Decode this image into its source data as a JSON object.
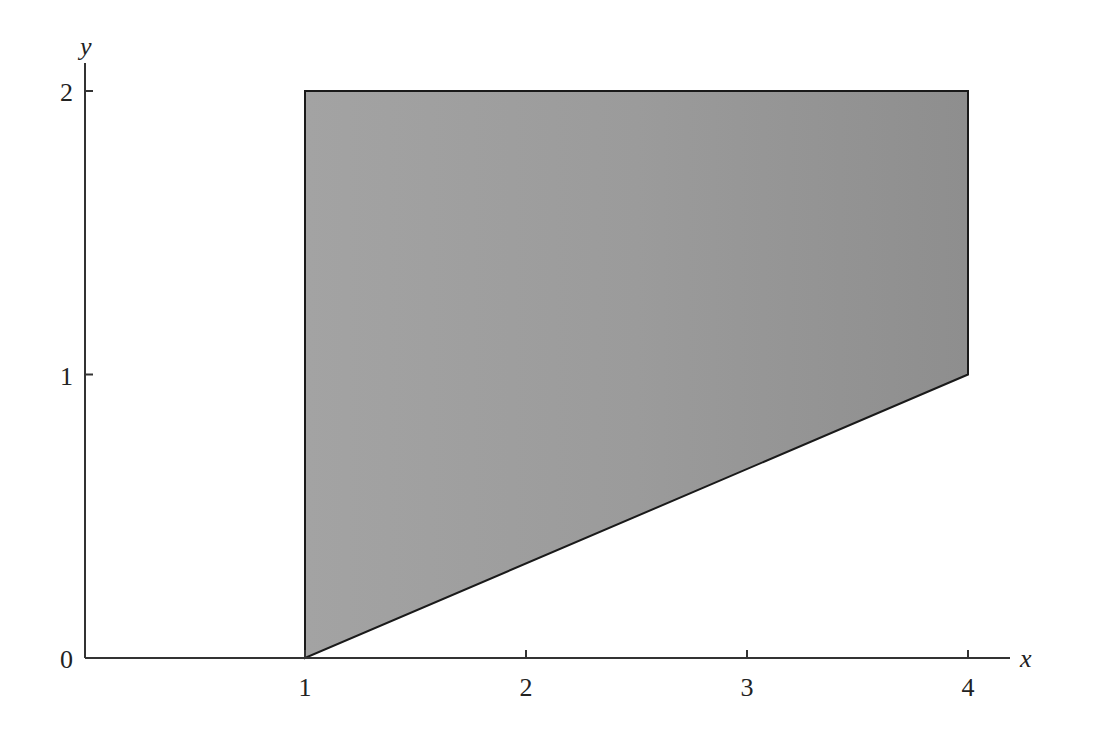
{
  "chart_data": {
    "type": "area",
    "title": "",
    "xlabel": "x",
    "ylabel": "y",
    "xlim": [
      0,
      4.2
    ],
    "ylim": [
      0,
      2.1
    ],
    "grid": false,
    "legend": null,
    "x_ticks": [
      "1",
      "2",
      "3",
      "4"
    ],
    "y_ticks": [
      "0",
      "1",
      "2"
    ],
    "region": {
      "description": "Shaded region bounded by x = 1, x = 4, y = 2, and y = x/3",
      "vertices": [
        [
          1,
          0
        ],
        [
          1,
          2
        ],
        [
          4,
          2
        ],
        [
          4,
          1
        ]
      ],
      "fill": "#9a9a9a",
      "stroke": "#1a1a1a"
    }
  },
  "axes": {
    "x_label": "x",
    "y_label": "y",
    "x_ticks": [
      {
        "value": 1,
        "label": "1"
      },
      {
        "value": 2,
        "label": "2"
      },
      {
        "value": 3,
        "label": "3"
      },
      {
        "value": 4,
        "label": "4"
      }
    ],
    "y_ticks": [
      {
        "value": 0,
        "label": "0"
      },
      {
        "value": 1,
        "label": "1"
      },
      {
        "value": 2,
        "label": "2"
      }
    ]
  },
  "colors": {
    "axis": "#333333",
    "region_fill": "#9a9a9a",
    "region_stroke": "#1a1a1a"
  }
}
